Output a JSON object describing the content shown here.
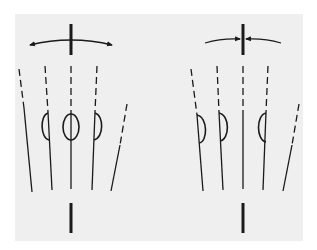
{
  "figure": {
    "background": "#ffffff",
    "panel_color": "#efefef",
    "stroke_color": "#1a1a1a",
    "diagrams": [
      {
        "id": "left",
        "description": "Outward-pointing curved double arrow above a vertical bar; five fanning lines with dashed upper portions, three with loop shapes (left half-loop, center full oval, right half-loop); bottom vertical bar",
        "arrow_direction": "outward",
        "top_bar_x": 71,
        "bottom_bar_x": 71,
        "loops": [
          "half-left",
          "full-oval",
          "half-right"
        ]
      },
      {
        "id": "right",
        "description": "Inward-pointing curved arrows converging on a vertical bar; five fanning lines with dashed upper portions, three with half-loop shapes; bottom vertical bar",
        "arrow_direction": "inward",
        "top_bar_x": 243,
        "bottom_bar_x": 243,
        "loops": [
          "half-right",
          "half-right",
          "half-left"
        ]
      }
    ]
  }
}
